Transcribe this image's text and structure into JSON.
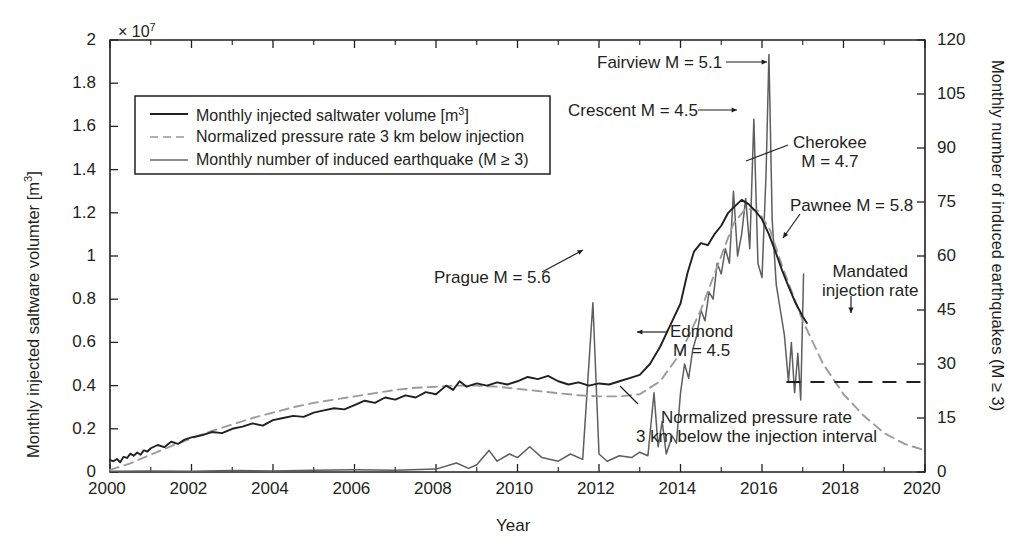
{
  "chart_data": {
    "type": "line",
    "title": "",
    "xlabel": "Year",
    "ylabel_left": "Monthly injected saltware volumter [m3]",
    "ylabel_right": "Monthly number of induced earthquakes (M ≥ 3)",
    "x_ticks": [
      "2000",
      "2002",
      "2004",
      "2006",
      "2008",
      "2010",
      "2012",
      "2014",
      "2016",
      "2018",
      "2020"
    ],
    "x_tick_values": [
      2000,
      2002,
      2004,
      2006,
      2008,
      2010,
      2012,
      2014,
      2016,
      2018,
      2020
    ],
    "xlim": [
      2000,
      2020
    ],
    "y_left_ticks": [
      "0",
      "0.2",
      "0.4",
      "0.6",
      "0.8",
      "1",
      "1.2",
      "1.4",
      "1.6",
      "1.8",
      "2"
    ],
    "y_left_tick_values": [
      0,
      0.2,
      0.4,
      0.6,
      0.8,
      1.0,
      1.2,
      1.4,
      1.6,
      1.8,
      2.0
    ],
    "y_left_exponent": "× 10",
    "y_left_exponent_power": "7",
    "ylim_left": [
      0,
      2
    ],
    "y_right_ticks": [
      "0",
      "15",
      "30",
      "45",
      "60",
      "75",
      "90",
      "105",
      "120"
    ],
    "y_right_tick_values": [
      0,
      15,
      30,
      45,
      60,
      75,
      90,
      105,
      120
    ],
    "ylim_right": [
      0,
      120
    ],
    "grid": false,
    "legend_position": "upper-left-inside",
    "series": [
      {
        "name": "Monthly injected saltwater volume [m3]",
        "axis": "left",
        "style": "solid",
        "color": "#231f20",
        "points": [
          [
            2000.0,
            0.055
          ],
          [
            2000.08,
            0.05
          ],
          [
            2000.17,
            0.06
          ],
          [
            2000.25,
            0.045
          ],
          [
            2000.33,
            0.07
          ],
          [
            2000.42,
            0.065
          ],
          [
            2000.5,
            0.085
          ],
          [
            2000.58,
            0.075
          ],
          [
            2000.67,
            0.09
          ],
          [
            2000.75,
            0.08
          ],
          [
            2000.83,
            0.1
          ],
          [
            2000.92,
            0.095
          ],
          [
            2001.0,
            0.11
          ],
          [
            2001.17,
            0.125
          ],
          [
            2001.33,
            0.115
          ],
          [
            2001.5,
            0.14
          ],
          [
            2001.67,
            0.13
          ],
          [
            2001.83,
            0.15
          ],
          [
            2002.0,
            0.16
          ],
          [
            2002.25,
            0.17
          ],
          [
            2002.5,
            0.185
          ],
          [
            2002.75,
            0.18
          ],
          [
            2003.0,
            0.2
          ],
          [
            2003.25,
            0.21
          ],
          [
            2003.5,
            0.225
          ],
          [
            2003.75,
            0.215
          ],
          [
            2004.0,
            0.24
          ],
          [
            2004.25,
            0.25
          ],
          [
            2004.5,
            0.26
          ],
          [
            2004.75,
            0.255
          ],
          [
            2005.0,
            0.275
          ],
          [
            2005.25,
            0.285
          ],
          [
            2005.5,
            0.295
          ],
          [
            2005.75,
            0.29
          ],
          [
            2006.0,
            0.31
          ],
          [
            2006.25,
            0.33
          ],
          [
            2006.5,
            0.32
          ],
          [
            2006.75,
            0.345
          ],
          [
            2007.0,
            0.335
          ],
          [
            2007.25,
            0.355
          ],
          [
            2007.5,
            0.345
          ],
          [
            2007.75,
            0.37
          ],
          [
            2008.0,
            0.36
          ],
          [
            2008.25,
            0.4
          ],
          [
            2008.42,
            0.38
          ],
          [
            2008.58,
            0.42
          ],
          [
            2008.75,
            0.395
          ],
          [
            2009.0,
            0.41
          ],
          [
            2009.25,
            0.4
          ],
          [
            2009.5,
            0.415
          ],
          [
            2009.75,
            0.405
          ],
          [
            2010.0,
            0.42
          ],
          [
            2010.25,
            0.44
          ],
          [
            2010.5,
            0.43
          ],
          [
            2010.75,
            0.445
          ],
          [
            2011.0,
            0.42
          ],
          [
            2011.25,
            0.405
          ],
          [
            2011.5,
            0.415
          ],
          [
            2011.75,
            0.4
          ],
          [
            2012.0,
            0.41
          ],
          [
            2012.25,
            0.405
          ],
          [
            2012.5,
            0.42
          ],
          [
            2012.75,
            0.435
          ],
          [
            2013.0,
            0.45
          ],
          [
            2013.25,
            0.5
          ],
          [
            2013.5,
            0.58
          ],
          [
            2013.75,
            0.68
          ],
          [
            2014.0,
            0.78
          ],
          [
            2014.17,
            0.92
          ],
          [
            2014.33,
            1.02
          ],
          [
            2014.5,
            1.06
          ],
          [
            2014.67,
            1.05
          ],
          [
            2014.83,
            1.1
          ],
          [
            2015.0,
            1.14
          ],
          [
            2015.17,
            1.2
          ],
          [
            2015.33,
            1.23
          ],
          [
            2015.5,
            1.26
          ],
          [
            2015.67,
            1.24
          ],
          [
            2015.83,
            1.21
          ],
          [
            2016.0,
            1.17
          ],
          [
            2016.17,
            1.1
          ],
          [
            2016.33,
            1.02
          ],
          [
            2016.5,
            0.93
          ],
          [
            2016.67,
            0.85
          ],
          [
            2016.83,
            0.78
          ],
          [
            2017.0,
            0.72
          ],
          [
            2017.1,
            0.69
          ]
        ]
      },
      {
        "name": "Normalized pressure rate 3 km below injection",
        "axis": "left",
        "style": "dashed",
        "color": "#9b9b9b",
        "points": [
          [
            2000.0,
            0.01
          ],
          [
            2000.5,
            0.04
          ],
          [
            2001.0,
            0.08
          ],
          [
            2001.5,
            0.12
          ],
          [
            2002.0,
            0.155
          ],
          [
            2002.5,
            0.19
          ],
          [
            2003.0,
            0.22
          ],
          [
            2003.5,
            0.25
          ],
          [
            2004.0,
            0.275
          ],
          [
            2004.5,
            0.3
          ],
          [
            2005.0,
            0.32
          ],
          [
            2005.5,
            0.335
          ],
          [
            2006.0,
            0.35
          ],
          [
            2006.5,
            0.365
          ],
          [
            2007.0,
            0.38
          ],
          [
            2007.5,
            0.39
          ],
          [
            2008.0,
            0.395
          ],
          [
            2008.5,
            0.4
          ],
          [
            2009.0,
            0.4
          ],
          [
            2009.5,
            0.395
          ],
          [
            2010.0,
            0.385
          ],
          [
            2010.5,
            0.375
          ],
          [
            2011.0,
            0.365
          ],
          [
            2011.5,
            0.355
          ],
          [
            2012.0,
            0.35
          ],
          [
            2012.5,
            0.35
          ],
          [
            2013.0,
            0.36
          ],
          [
            2013.5,
            0.42
          ],
          [
            2014.0,
            0.55
          ],
          [
            2014.5,
            0.75
          ],
          [
            2015.0,
            1.0
          ],
          [
            2015.3,
            1.15
          ],
          [
            2015.6,
            1.22
          ],
          [
            2015.9,
            1.21
          ],
          [
            2016.2,
            1.12
          ],
          [
            2016.5,
            0.95
          ],
          [
            2017.0,
            0.7
          ],
          [
            2017.5,
            0.5
          ],
          [
            2018.0,
            0.36
          ],
          [
            2018.5,
            0.26
          ],
          [
            2019.0,
            0.18
          ],
          [
            2019.5,
            0.13
          ],
          [
            2020.0,
            0.1
          ]
        ]
      },
      {
        "name": "Monthly number of induced earthquake (M ≥ 3)",
        "axis": "right",
        "style": "solid",
        "color": "#5d5d5d",
        "points": [
          [
            2000.0,
            0.2
          ],
          [
            2001.0,
            0.3
          ],
          [
            2002.0,
            0.2
          ],
          [
            2003.0,
            0.4
          ],
          [
            2004.0,
            0.3
          ],
          [
            2005.0,
            0.5
          ],
          [
            2006.0,
            0.6
          ],
          [
            2007.0,
            0.5
          ],
          [
            2008.0,
            0.8
          ],
          [
            2008.5,
            2.5
          ],
          [
            2008.8,
            1.0
          ],
          [
            2009.0,
            2.0
          ],
          [
            2009.3,
            6.0
          ],
          [
            2009.5,
            3.0
          ],
          [
            2009.8,
            5.0
          ],
          [
            2010.0,
            4.0
          ],
          [
            2010.3,
            7.0
          ],
          [
            2010.6,
            4.0
          ],
          [
            2011.0,
            3.0
          ],
          [
            2011.3,
            5.0
          ],
          [
            2011.6,
            3.5
          ],
          [
            2011.85,
            47.0
          ],
          [
            2012.0,
            5.0
          ],
          [
            2012.2,
            3.0
          ],
          [
            2012.5,
            4.5
          ],
          [
            2012.8,
            4.0
          ],
          [
            2013.0,
            5.5
          ],
          [
            2013.2,
            4.5
          ],
          [
            2013.35,
            22.0
          ],
          [
            2013.45,
            7.0
          ],
          [
            2013.55,
            14.0
          ],
          [
            2013.65,
            5.0
          ],
          [
            2013.8,
            10.0
          ],
          [
            2013.9,
            8.0
          ],
          [
            2014.0,
            22.0
          ],
          [
            2014.1,
            30.0
          ],
          [
            2014.2,
            26.0
          ],
          [
            2014.3,
            34.0
          ],
          [
            2014.4,
            38.0
          ],
          [
            2014.5,
            45.0
          ],
          [
            2014.6,
            42.0
          ],
          [
            2014.7,
            50.0
          ],
          [
            2014.8,
            48.0
          ],
          [
            2014.9,
            58.0
          ],
          [
            2015.0,
            55.0
          ],
          [
            2015.1,
            62.0
          ],
          [
            2015.2,
            58.0
          ],
          [
            2015.3,
            78.0
          ],
          [
            2015.4,
            60.0
          ],
          [
            2015.5,
            66.0
          ],
          [
            2015.6,
            76.0
          ],
          [
            2015.7,
            62.0
          ],
          [
            2015.8,
            98.0
          ],
          [
            2015.9,
            58.0
          ],
          [
            2016.0,
            54.0
          ],
          [
            2016.1,
            83.0
          ],
          [
            2016.17,
            116.0
          ],
          [
            2016.25,
            70.0
          ],
          [
            2016.35,
            52.0
          ],
          [
            2016.45,
            45.0
          ],
          [
            2016.55,
            38.0
          ],
          [
            2016.65,
            25.0
          ],
          [
            2016.72,
            36.0
          ],
          [
            2016.8,
            22.0
          ],
          [
            2016.88,
            33.0
          ],
          [
            2016.95,
            20.0
          ],
          [
            2017.02,
            55.0
          ]
        ]
      }
    ],
    "mandated_injection_rate": {
      "label": "Mandated\ninjection rate",
      "value_right_axis": 25,
      "x_start": 2016.6,
      "x_end": 2020.0,
      "style": "dashed"
    },
    "annotations": [
      {
        "id": "fairview",
        "text": "Fairview M = 5.1",
        "magnitude": 5.1,
        "event": "Fairview"
      },
      {
        "id": "crescent",
        "text": "Crescent M = 4.5",
        "magnitude": 4.5,
        "event": "Crescent"
      },
      {
        "id": "cherokee",
        "line1": "Cherokee",
        "line2": "M = 4.7",
        "magnitude": 4.7,
        "event": "Cherokee"
      },
      {
        "id": "pawnee",
        "text": "Pawnee M = 5.8",
        "magnitude": 5.8,
        "event": "Pawnee"
      },
      {
        "id": "prague",
        "text": "Prague M = 5.6",
        "magnitude": 5.6,
        "event": "Prague"
      },
      {
        "id": "edmond",
        "line1": "Edmond",
        "line2": "M = 4.5",
        "magnitude": 4.5,
        "event": "Edmond"
      },
      {
        "id": "mandated",
        "line1": "Mandated",
        "line2": "injection rate"
      },
      {
        "id": "pressure-note",
        "line1": "Normalized pressure rate",
        "line2": "3 km below the injection interval"
      }
    ]
  },
  "legend": {
    "items": [
      {
        "label": "Monthly injected saltwater volume [m",
        "sup": "3",
        "tail": "]"
      },
      {
        "label": "Normalized pressure rate 3 km below injection",
        "sup": "",
        "tail": ""
      },
      {
        "label": "Monthly number of induced earthquake (M ≥ 3)",
        "sup": "",
        "tail": ""
      }
    ]
  },
  "axes": {
    "x_label": "Year",
    "y_left_label_pre": "Monthly injected saltware volumter [m",
    "y_left_label_sup": "3",
    "y_left_label_post": "]",
    "y_right_label": "Monthly number of induced earthquakes (M ≥ 3)",
    "exponent_pre": "× 10",
    "exponent_sup": "7"
  }
}
